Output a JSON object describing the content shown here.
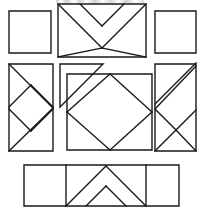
{
  "document": {
    "title": "Quilt Block Pattern Diagram",
    "kind": "line-drawing",
    "description": "Exploded quilt block piecing diagram showing nine pattern units arranged in three rows",
    "background_color": "#ffffff",
    "line_color": "#1a1a1a",
    "line_width": 1.4,
    "canvas": {
      "width": 203,
      "height": 212
    }
  },
  "artifact": {
    "name": "cropped-text-row",
    "label": "",
    "x": 56,
    "y": 0,
    "width": 88,
    "height": 3
  },
  "units": [
    {
      "id": "top-left-plain-square",
      "label": "Plain Square",
      "row": 1,
      "column": 1,
      "shape": "square",
      "outline": [
        [
          9,
          11
        ],
        [
          51,
          11
        ],
        [
          51,
          53
        ],
        [
          9,
          53
        ]
      ],
      "inner_lines": []
    },
    {
      "id": "top-center-peak-unit",
      "label": "Peak and Diamond Unit",
      "row": 1,
      "column": 2,
      "shape": "rectangle",
      "outline": [
        [
          58,
          4
        ],
        [
          146,
          4
        ],
        [
          146,
          57
        ],
        [
          58,
          57
        ]
      ],
      "inner_lines": [
        [
          [
            58,
            4
          ],
          [
            102,
            48
          ]
        ],
        [
          [
            146,
            4
          ],
          [
            102,
            48
          ]
        ],
        [
          [
            80,
            4
          ],
          [
            102,
            26
          ]
        ],
        [
          [
            124,
            4
          ],
          [
            102,
            26
          ]
        ],
        [
          [
            58,
            57
          ],
          [
            102,
            48
          ]
        ],
        [
          [
            146,
            57
          ],
          [
            102,
            48
          ]
        ]
      ]
    },
    {
      "id": "top-right-plain-square",
      "label": "Plain Square",
      "row": 1,
      "column": 3,
      "shape": "square",
      "outline": [
        [
          155,
          11
        ],
        [
          196,
          11
        ],
        [
          196,
          53
        ],
        [
          155,
          53
        ]
      ],
      "inner_lines": []
    },
    {
      "id": "mid-left-diamond-strip",
      "label": "Diamond Zigzag Strip",
      "row": 2,
      "column": 1,
      "shape": "tall-rectangle",
      "outline": [
        [
          9,
          64
        ],
        [
          53,
          64
        ],
        [
          53,
          151
        ],
        [
          9,
          151
        ]
      ],
      "inner_lines": [
        [
          [
            9,
            64
          ],
          [
            53,
            108
          ]
        ],
        [
          [
            53,
            108
          ],
          [
            9,
            151
          ]
        ],
        [
          [
            9,
            107
          ],
          [
            31,
            85
          ]
        ],
        [
          [
            31,
            85
          ],
          [
            53,
            107
          ]
        ],
        [
          [
            9,
            109
          ],
          [
            31,
            131
          ]
        ],
        [
          [
            31,
            131
          ],
          [
            53,
            109
          ]
        ]
      ]
    },
    {
      "id": "mid-center-square-in-square",
      "label": "Square in a Square",
      "row": 2,
      "column": 2,
      "shape": "square",
      "outline": [
        [
          67,
          74
        ],
        [
          152,
          74
        ],
        [
          152,
          150
        ],
        [
          67,
          150
        ]
      ],
      "inner_lines": [
        [
          [
            67,
            112
          ],
          [
            110,
            74
          ]
        ],
        [
          [
            110,
            74
          ],
          [
            152,
            112
          ]
        ],
        [
          [
            152,
            112
          ],
          [
            110,
            150
          ]
        ],
        [
          [
            110,
            150
          ],
          [
            67,
            112
          ]
        ]
      ]
    },
    {
      "id": "mid-center-corner-triangle",
      "label": "Corner Half Square Triangle",
      "row": 2,
      "column": 2,
      "shape": "right-triangle",
      "outline": [
        [
          60,
          64
        ],
        [
          103,
          64
        ],
        [
          60,
          107
        ]
      ],
      "inner_lines": []
    },
    {
      "id": "mid-right-diagonal-diamond",
      "label": "Diagonal and Diamond Strip",
      "row": 2,
      "column": 3,
      "shape": "tall-rectangle",
      "outline": [
        [
          155,
          64
        ],
        [
          196,
          64
        ],
        [
          196,
          151
        ],
        [
          155,
          151
        ]
      ],
      "inner_lines": [
        [
          [
            155,
            109
          ],
          [
            196,
            66
          ]
        ],
        [
          [
            155,
            104
          ],
          [
            196,
            63
          ]
        ],
        [
          [
            155,
            109
          ],
          [
            176,
            130
          ]
        ],
        [
          [
            176,
            130
          ],
          [
            196,
            110
          ]
        ],
        [
          [
            155,
            151
          ],
          [
            176,
            130
          ]
        ],
        [
          [
            196,
            151
          ],
          [
            176,
            130
          ]
        ]
      ]
    },
    {
      "id": "bottom-strip",
      "label": "Three Panel Border Strip",
      "row": 3,
      "column": 1,
      "shape": "wide-rectangle",
      "outline": [
        [
          24,
          165
        ],
        [
          179,
          165
        ],
        [
          179,
          206
        ],
        [
          24,
          206
        ]
      ],
      "inner_lines": [
        [
          [
            66,
            165
          ],
          [
            66,
            206
          ]
        ],
        [
          [
            146,
            165
          ],
          [
            146,
            206
          ]
        ],
        [
          [
            66,
            206
          ],
          [
            106,
            166
          ]
        ],
        [
          [
            106,
            166
          ],
          [
            146,
            206
          ]
        ],
        [
          [
            86,
            206
          ],
          [
            106,
            186
          ]
        ],
        [
          [
            106,
            186
          ],
          [
            126,
            206
          ]
        ]
      ]
    }
  ]
}
